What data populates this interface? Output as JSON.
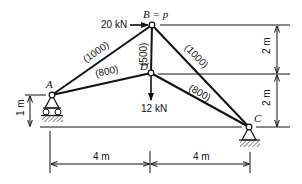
{
  "diagram": {
    "type": "truss",
    "nodes": {
      "A": {
        "label": "A"
      },
      "B": {
        "label": "B = p"
      },
      "C": {
        "label": "C"
      },
      "D": {
        "label": "D"
      }
    },
    "members": {
      "AB": {
        "label": "(1000)"
      },
      "AD": {
        "label": "(800)"
      },
      "BD": {
        "label": "(500)"
      },
      "BC": {
        "label": "(1000)"
      },
      "DC": {
        "label": "(800)"
      }
    },
    "loads": {
      "horizontal_at_B": {
        "label": "20 kN",
        "direction": "right"
      },
      "vertical_at_D": {
        "label": "12 kN",
        "direction": "down"
      }
    },
    "supports": {
      "A": "roller",
      "C": "pin"
    },
    "dimensions": {
      "right_upper": "2 m",
      "right_lower": "2 m",
      "left_height": "1 m",
      "bottom_left": "4 m",
      "bottom_right": "4 m"
    }
  }
}
